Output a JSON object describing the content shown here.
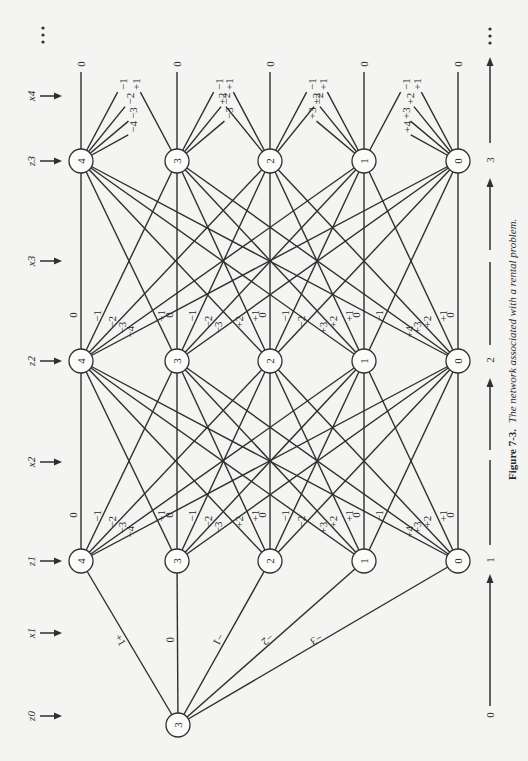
{
  "figure": {
    "caption_number": "Figure 7-3.",
    "caption_text": "The network associated with a rental problem.",
    "ellipsis": "⋮"
  },
  "stage_labels": {
    "z0": "z0",
    "x1": "x1",
    "z1": "z1",
    "x2": "x2",
    "z2": "z2",
    "x3": "x3",
    "z3": "z3",
    "x4": "x4"
  },
  "time_axis": {
    "ticks": [
      "0",
      "1",
      "2",
      "3"
    ]
  },
  "network": {
    "initial_node": {
      "stage": "z0",
      "value": "3"
    },
    "state_values": [
      "4",
      "3",
      "2",
      "1",
      "0"
    ],
    "layers": [
      {
        "stage": "z1",
        "nodes": [
          "4",
          "3",
          "2",
          "1",
          "0"
        ]
      },
      {
        "stage": "z2",
        "nodes": [
          "4",
          "3",
          "2",
          "1",
          "0"
        ]
      },
      {
        "stage": "z3",
        "nodes": [
          "4",
          "3",
          "2",
          "1",
          "0"
        ]
      }
    ],
    "z0_to_z1_weights": [
      "+1",
      "0",
      "−1",
      "−2",
      "−3"
    ],
    "transition_weight_rule": "weight = destination state − origin state",
    "x4_stub_weights": {
      "4": [
        "0",
        "−1",
        "−2",
        "−3",
        "−4"
      ],
      "3": [
        "+1",
        "0",
        "−1",
        "−2",
        "−3"
      ],
      "2": [
        "+2",
        "+1",
        "0",
        "−1",
        "−2"
      ],
      "1": [
        "+3",
        "+2",
        "+1",
        "0",
        "−1"
      ],
      "0": [
        "+4",
        "+3",
        "+2",
        "+1",
        "0"
      ]
    }
  }
}
